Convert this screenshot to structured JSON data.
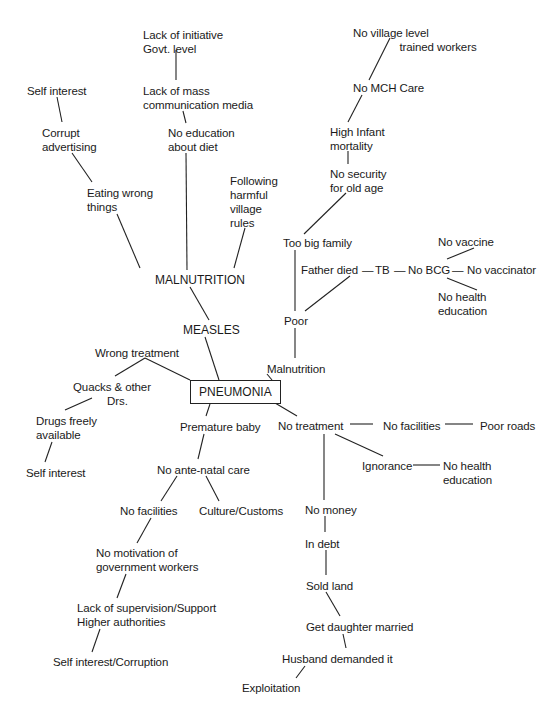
{
  "diagram": {
    "type": "cause-tree",
    "root": "PNEUMONIA",
    "nodes": [
      {
        "id": "lack_initiative",
        "text": "Lack of initiative\nGovt. level",
        "x": 143,
        "y": 28
      },
      {
        "id": "lack_mass_media",
        "text": "Lack of mass\ncommunication media",
        "x": 143,
        "y": 84
      },
      {
        "id": "self_interest_top",
        "text": "Self interest",
        "x": 27,
        "y": 84
      },
      {
        "id": "corrupt_advertising",
        "text": "Corrupt\nadvertising",
        "x": 42,
        "y": 126
      },
      {
        "id": "no_education_diet",
        "text": "No education\nabout diet",
        "x": 168,
        "y": 126
      },
      {
        "id": "following_rules",
        "text": "Following\nharmful\nvillage\nrules",
        "x": 230,
        "y": 174
      },
      {
        "id": "eating_wrong",
        "text": "Eating wrong\nthings",
        "x": 87,
        "y": 186
      },
      {
        "id": "malnutrition_main",
        "text": "MALNUTRITION",
        "x": 155,
        "y": 273,
        "caps": true
      },
      {
        "id": "measles",
        "text": "MEASLES",
        "x": 183,
        "y": 323,
        "caps": true
      },
      {
        "id": "wrong_treatment",
        "text": "Wrong treatment",
        "x": 95,
        "y": 346
      },
      {
        "id": "quacks",
        "text": "Quacks & other\n           Drs.",
        "x": 73,
        "y": 380
      },
      {
        "id": "drugs_freely",
        "text": "Drugs freely\navailable",
        "x": 36,
        "y": 414
      },
      {
        "id": "self_interest_left",
        "text": "Self interest",
        "x": 26,
        "y": 466
      },
      {
        "id": "premature_baby",
        "text": "Premature baby",
        "x": 180,
        "y": 420
      },
      {
        "id": "no_antenatal",
        "text": "No ante-natal care",
        "x": 157,
        "y": 463
      },
      {
        "id": "no_facilities_left",
        "text": "No facilities",
        "x": 120,
        "y": 504
      },
      {
        "id": "culture_customs",
        "text": "Culture/Customs",
        "x": 199,
        "y": 504
      },
      {
        "id": "no_motivation",
        "text": "No motivation of\ngovernment workers",
        "x": 96,
        "y": 546
      },
      {
        "id": "lack_supervision",
        "text": "Lack of supervision/Support\nHigher authorities",
        "x": 77,
        "y": 601
      },
      {
        "id": "self_interest_corruption",
        "text": "Self interest/Corruption",
        "x": 53,
        "y": 655
      },
      {
        "id": "no_village_workers",
        "text": "No village level\n               trained workers",
        "x": 353,
        "y": 26
      },
      {
        "id": "no_mch",
        "text": "No MCH Care",
        "x": 353,
        "y": 81
      },
      {
        "id": "high_infant",
        "text": "High Infant\nmortality",
        "x": 330,
        "y": 125
      },
      {
        "id": "no_security",
        "text": "No security\nfor old age",
        "x": 330,
        "y": 167
      },
      {
        "id": "too_big_family",
        "text": "Too big family",
        "x": 283,
        "y": 236
      },
      {
        "id": "no_vaccine",
        "text": "No vaccine",
        "x": 438,
        "y": 235
      },
      {
        "id": "father_died",
        "text": "Father died",
        "x": 301,
        "y": 263
      },
      {
        "id": "tb",
        "text": "TB",
        "x": 375,
        "y": 263
      },
      {
        "id": "no_bcg",
        "text": "No BCG",
        "x": 408,
        "y": 263
      },
      {
        "id": "no_vaccinator",
        "text": "No vaccinator",
        "x": 467,
        "y": 263
      },
      {
        "id": "no_health_edu_top",
        "text": "No health\neducation",
        "x": 438,
        "y": 290
      },
      {
        "id": "poor",
        "text": "Poor",
        "x": 284,
        "y": 314
      },
      {
        "id": "malnutrition_right",
        "text": "Malnutrition",
        "x": 267,
        "y": 362
      },
      {
        "id": "no_treatment",
        "text": "No treatment",
        "x": 278,
        "y": 419
      },
      {
        "id": "no_facilities_right",
        "text": "No facilities",
        "x": 383,
        "y": 419
      },
      {
        "id": "poor_roads",
        "text": "Poor roads",
        "x": 480,
        "y": 419
      },
      {
        "id": "ignorance",
        "text": "Ignorance",
        "x": 362,
        "y": 459
      },
      {
        "id": "no_health_edu_bottom",
        "text": "No health\neducation",
        "x": 443,
        "y": 459
      },
      {
        "id": "no_money",
        "text": "No money",
        "x": 305,
        "y": 503
      },
      {
        "id": "in_debt",
        "text": "In debt",
        "x": 305,
        "y": 537
      },
      {
        "id": "sold_land",
        "text": "Sold land",
        "x": 306,
        "y": 579
      },
      {
        "id": "get_daughter",
        "text": "Get daughter married",
        "x": 306,
        "y": 620
      },
      {
        "id": "husband_demanded",
        "text": "Husband demanded it",
        "x": 282,
        "y": 652
      },
      {
        "id": "exploitation",
        "text": "Exploitation",
        "x": 242,
        "y": 681
      }
    ],
    "box": {
      "id": "pneumonia",
      "text": "PNEUMONIA",
      "x": 190,
      "y": 380,
      "w": 82,
      "h": 24
    },
    "dashes": [
      {
        "text": "—",
        "x": 362,
        "y": 263
      },
      {
        "text": "—",
        "x": 394,
        "y": 263
      },
      {
        "text": "—",
        "x": 452,
        "y": 263
      }
    ],
    "edges": [
      [
        176,
        50,
        176,
        80
      ],
      [
        57,
        97,
        62,
        122
      ],
      [
        183,
        111,
        186,
        123
      ],
      [
        72,
        153,
        92,
        182
      ],
      [
        186,
        153,
        187,
        270
      ],
      [
        117,
        214,
        140,
        268
      ],
      [
        245,
        228,
        234,
        268
      ],
      [
        190,
        287,
        209,
        320
      ],
      [
        205,
        337,
        219,
        380
      ],
      [
        145,
        358,
        115,
        376
      ],
      [
        145,
        358,
        190,
        380
      ],
      [
        92,
        398,
        65,
        410
      ],
      [
        52,
        442,
        45,
        462
      ],
      [
        210,
        404,
        206,
        416
      ],
      [
        204,
        434,
        198,
        459
      ],
      [
        177,
        476,
        161,
        501
      ],
      [
        206,
        476,
        219,
        501
      ],
      [
        151,
        518,
        137,
        543
      ],
      [
        126,
        574,
        117,
        598
      ],
      [
        100,
        629,
        92,
        652
      ],
      [
        390,
        38,
        369,
        80
      ],
      [
        362,
        95,
        348,
        122
      ],
      [
        348,
        151,
        348,
        164
      ],
      [
        346,
        193,
        304,
        234
      ],
      [
        295,
        250,
        295,
        311
      ],
      [
        305,
        311,
        350,
        276
      ],
      [
        447,
        259,
        474,
        248
      ],
      [
        447,
        278,
        477,
        290
      ],
      [
        295,
        328,
        295,
        358
      ],
      [
        267,
        374,
        272,
        380
      ],
      [
        270,
        400,
        297,
        416
      ],
      [
        350,
        424,
        373,
        424
      ],
      [
        445,
        424,
        473,
        424
      ],
      [
        324,
        434,
        324,
        500
      ],
      [
        335,
        434,
        383,
        456
      ],
      [
        413,
        465,
        440,
        465
      ],
      [
        325,
        516,
        325,
        532
      ],
      [
        326,
        550,
        326,
        575
      ],
      [
        326,
        592,
        340,
        616
      ],
      [
        343,
        634,
        346,
        648
      ],
      [
        305,
        666,
        296,
        678
      ]
    ]
  }
}
